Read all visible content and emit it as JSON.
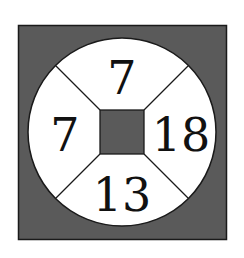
{
  "diagram": {
    "colors": {
      "background": "#ffffff",
      "outer_square_fill": "#5a5a5a",
      "circle_fill": "#ffffff",
      "inner_square_fill": "#5a5a5a",
      "stroke": "#1a1a1a"
    },
    "sectors": {
      "top": "7",
      "left": "7",
      "right": "18",
      "bottom": "13"
    }
  }
}
